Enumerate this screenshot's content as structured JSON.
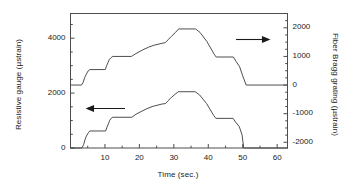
{
  "chart_data": {
    "type": "line",
    "title": "",
    "xlabel": "Time (sec.)",
    "xlim": [
      0,
      63
    ],
    "xticks": [
      10,
      20,
      30,
      40,
      50,
      60
    ],
    "xticklabels": [
      "10",
      "20",
      "30",
      "40",
      "50",
      "60"
    ],
    "grid": false,
    "legend": "none",
    "annotations": [
      {
        "name": "left-arrow-annotation",
        "text": "←",
        "points_to": "resistive-gauge-curve",
        "axis": "left"
      },
      {
        "name": "right-arrow-annotation",
        "text": "→",
        "points_to": "fiber-bragg-grating-curve",
        "axis": "right"
      }
    ],
    "axes": [
      {
        "id": "left",
        "label": "Resistive gauge (µstrain)",
        "ylim": [
          0,
          4900
        ],
        "yticks": [
          0,
          2000,
          4000
        ],
        "yticklabels": [
          "0",
          "2000",
          "4000"
        ]
      },
      {
        "id": "right",
        "label": "Fiber Bragg grating (µstrain)",
        "ylim": [
          -2200,
          2500
        ],
        "yticks": [
          -2000,
          -1000,
          0,
          1000,
          2000
        ],
        "yticklabels": [
          "-2000",
          "-1000",
          "0",
          "1000",
          "2000"
        ]
      }
    ],
    "series": [
      {
        "name": "Resistive gauge",
        "axis": "left",
        "units": "µstrain",
        "color": "#4d4d4d",
        "x": [
          0.0,
          3.3,
          3.8,
          4.2,
          4.6,
          5.2,
          5.6,
          10.2,
          10.6,
          11.0,
          11.4,
          11.8,
          12.3,
          17.8,
          19.0,
          21.0,
          22.5,
          24.0,
          26.5,
          27.6,
          28.3,
          29.2,
          30.3,
          31.3,
          36.2,
          37.5,
          39.5,
          41.6,
          42.2,
          47.2,
          48.0,
          49.0,
          49.8,
          50.3,
          63.0
        ],
        "y": [
          0,
          0,
          120,
          300,
          430,
          560,
          620,
          620,
          760,
          880,
          1010,
          1080,
          1120,
          1120,
          1230,
          1360,
          1450,
          1520,
          1600,
          1620,
          1720,
          1830,
          1950,
          2050,
          2050,
          1930,
          1620,
          1180,
          1080,
          1080,
          930,
          780,
          480,
          0,
          0
        ]
      },
      {
        "name": "Fiber Bragg grating",
        "axis": "right",
        "units": "µstrain",
        "color": "#4d4d4d",
        "x": [
          0.0,
          3.2,
          3.7,
          4.1,
          4.6,
          5.1,
          5.6,
          10.1,
          10.5,
          10.9,
          11.3,
          11.8,
          12.3,
          17.7,
          19.0,
          21.0,
          22.6,
          24.2,
          26.6,
          27.5,
          28.3,
          29.3,
          30.4,
          31.4,
          36.3,
          37.6,
          39.6,
          41.7,
          42.3,
          47.3,
          48.1,
          49.1,
          50.0,
          51.0,
          63.0
        ],
        "y": [
          0,
          0,
          100,
          260,
          380,
          490,
          540,
          540,
          680,
          790,
          900,
          960,
          1000,
          1000,
          1100,
          1230,
          1320,
          1390,
          1460,
          1480,
          1580,
          1700,
          1830,
          1960,
          1960,
          1840,
          1520,
          1080,
          980,
          980,
          820,
          640,
          320,
          0,
          0
        ]
      }
    ]
  }
}
